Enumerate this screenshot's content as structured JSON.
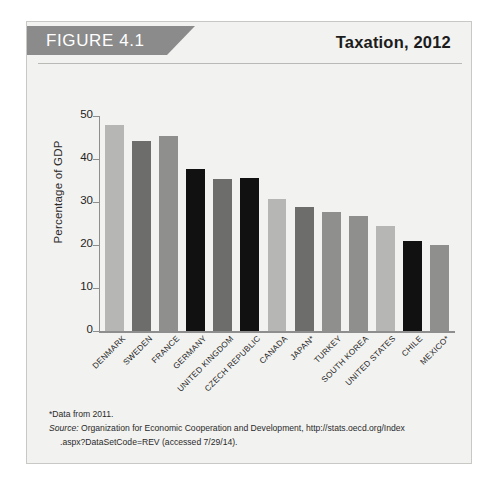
{
  "figure": {
    "banner_label": "FIGURE 4.1",
    "title": "Taxation, 2012"
  },
  "notes": {
    "asterisk": "*Data from 2011.",
    "source_word": "Source:",
    "source_text": " Organization for Economic Cooperation and Development, http://stats.oecd.org/Index",
    "source_cont": ".aspx?DataSetCode=REV (accessed 7/29/14)."
  },
  "colors": {
    "banner": "#8b8b8b",
    "panel": "#f2f2f0",
    "border": "#c8c8c4",
    "axis": "#8e8e8e",
    "bar_light": "#b6b6b4",
    "bar_medium": "#8f8f8d",
    "bar_dark": "#6d6d6b",
    "bar_black": "#111111"
  },
  "chart_data": {
    "type": "bar",
    "title": "Taxation, 2012",
    "xlabel": "",
    "ylabel": "Percentage of GDP",
    "ylim": [
      0,
      50
    ],
    "yticks": [
      0,
      10,
      20,
      30,
      40,
      50
    ],
    "grid": false,
    "legend": "none",
    "categories": [
      "DENMARK",
      "SWEDEN",
      "FRANCE",
      "GERMANY",
      "UNITED KINGDOM",
      "CZECH REPUBLIC",
      "CANADA",
      "JAPAN*",
      "TURKEY",
      "SOUTH KOREA",
      "UNITED STATES",
      "CHILE",
      "MEXICO*"
    ],
    "values": [
      48.0,
      44.2,
      45.3,
      37.7,
      35.3,
      35.6,
      30.7,
      28.8,
      27.7,
      26.8,
      24.4,
      21.0,
      19.9
    ],
    "bar_colors": [
      "#b6b6b4",
      "#6d6d6b",
      "#8f8f8d",
      "#111111",
      "#6d6d6b",
      "#111111",
      "#b6b6b4",
      "#6d6d6b",
      "#8f8f8d",
      "#8f8f8d",
      "#b6b6b4",
      "#111111",
      "#8f8f8d"
    ]
  }
}
